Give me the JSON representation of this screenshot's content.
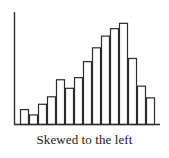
{
  "figure": {
    "caption": "Skewed to the left",
    "axis_color": "#2b2b2b",
    "bar_stroke_color": "#2b2b2b",
    "bar_fill_color": "#ffffff",
    "background_color": "#ffffff"
  },
  "chart_data": {
    "type": "bar",
    "title": "",
    "subtitle": "",
    "xlabel": "",
    "ylabel": "",
    "annotations": [
      "Skewed to the left"
    ],
    "legend": [],
    "grid": false,
    "categories": [
      "1",
      "2",
      "3",
      "4",
      "5",
      "6",
      "7",
      "8",
      "9",
      "10",
      "11",
      "12",
      "13",
      "14",
      "15"
    ],
    "values": [
      14,
      9,
      19,
      26,
      42,
      34,
      44,
      59,
      72,
      83,
      90,
      95,
      62,
      36,
      25
    ],
    "xlim": [
      0,
      15
    ],
    "ylim": [
      0,
      100
    ],
    "skew": "left",
    "axis": {
      "y_axis_visible": true,
      "x_axis_visible": true,
      "ticks": false,
      "tick_labels": []
    }
  }
}
